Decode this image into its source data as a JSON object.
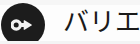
{
  "canvas": {
    "width": 140,
    "height": 44,
    "background_color": "#fdfdfd"
  },
  "badge": {
    "name": "key-badge",
    "shape": "circle",
    "fill_color": "#1c1c1c",
    "glyph_color": "#f2f2f2",
    "icon": "key-icon"
  },
  "label": {
    "text": "バリエ",
    "truncated": true,
    "color": "#1a1a1a"
  }
}
